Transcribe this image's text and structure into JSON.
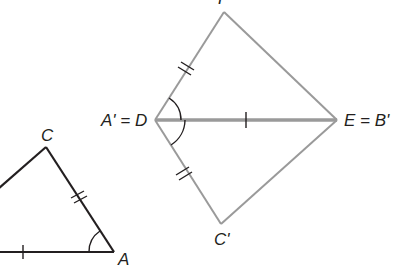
{
  "figure": {
    "type": "geometry-congruence-diagram",
    "colors": {
      "original_triangle": "#231f20",
      "image_figure": "#9a9a9a",
      "marks": "#231f20"
    },
    "original_triangle": {
      "labels": {
        "C": "C",
        "A": "A"
      }
    },
    "image_figure": {
      "labels": {
        "top": "F",
        "left": "A' = D",
        "right": "E = B'",
        "bottom": "C'"
      }
    },
    "marks": {
      "single_tick": "side AB ≅ side DE",
      "double_tick": "side AC ≅ side DF ≅ side DC'",
      "angle_arc": "∠A ≅ ∠FDE ≅ ∠C'DE"
    }
  }
}
